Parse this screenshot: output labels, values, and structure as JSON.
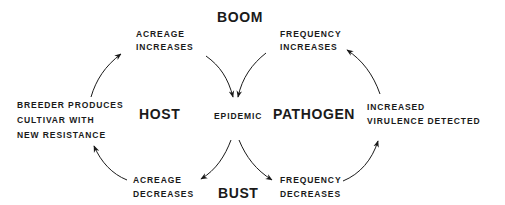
{
  "diagram": {
    "type": "boom-and-bust cycle",
    "colors": {
      "ink": "#1a1a1a",
      "background": "#ffffff"
    },
    "title_top": "BOOM",
    "title_bottom": "BUST",
    "center": "EPIDEMIC",
    "left_label": "HOST",
    "right_label": "PATHOGEN",
    "nodes": {
      "acreage_increases": [
        "ACREAGE",
        "INCREASES"
      ],
      "frequency_increases": [
        "FREQUENCY",
        "INCREASES"
      ],
      "breeder": [
        "BREEDER PRODUCES",
        "CULTIVAR WITH",
        "NEW RESISTANCE"
      ],
      "virulence": [
        "INCREASED",
        "VIRULENCE DETECTED"
      ],
      "acreage_decreases": [
        "ACREAGE",
        "DECREASES"
      ],
      "frequency_decreases": [
        "FREQUENCY",
        "DECREASES"
      ]
    },
    "edges": [
      {
        "from": "breeder",
        "to": "acreage_increases"
      },
      {
        "from": "acreage_increases",
        "to": "epidemic"
      },
      {
        "from": "frequency_increases",
        "to": "epidemic"
      },
      {
        "from": "virulence",
        "to": "frequency_increases"
      },
      {
        "from": "epidemic",
        "to": "acreage_decreases"
      },
      {
        "from": "epidemic",
        "to": "frequency_decreases"
      },
      {
        "from": "acreage_decreases",
        "to": "breeder"
      },
      {
        "from": "frequency_decreases",
        "to": "virulence"
      }
    ]
  }
}
